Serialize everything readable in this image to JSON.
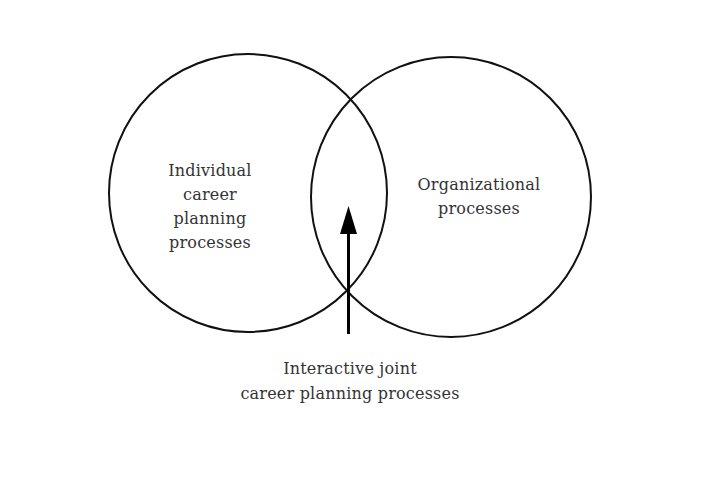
{
  "diagram": {
    "type": "venn",
    "colors": {
      "stroke": "#111111",
      "text": "#333333",
      "background": "#ffffff"
    },
    "circles": [
      {
        "id": "individual",
        "cx": 248,
        "cy": 193,
        "r": 139,
        "label_lines": [
          "Individual",
          "career",
          "planning",
          "processes"
        ]
      },
      {
        "id": "organizational",
        "cx": 451,
        "cy": 197,
        "r": 140,
        "label_lines": [
          "Organizational",
          "processes"
        ]
      }
    ],
    "arrow": {
      "x": 348,
      "y_start": 334,
      "y_end": 206,
      "direction": "up",
      "points_to": "intersection"
    },
    "intersection_label_lines": [
      "Interactive joint",
      "career planning processes"
    ]
  }
}
